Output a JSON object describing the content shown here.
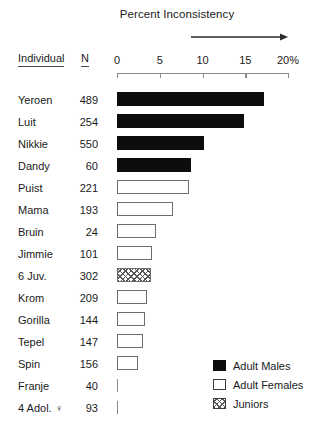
{
  "chart_data": {
    "type": "bar",
    "orientation": "horizontal",
    "title": "Percent Inconsistency",
    "xlabel": "",
    "ylabel": "Individual",
    "xlim": [
      0,
      20
    ],
    "grid": false,
    "axis": {
      "ticks": [
        0,
        5,
        10,
        15,
        20
      ],
      "tick_labels": [
        "0",
        "5",
        "10",
        "15",
        "20%"
      ]
    },
    "annotations": [
      {
        "name": "direction-arrow",
        "text": "",
        "description": "rightward arrow above axis spanning ~9% to ~20%"
      }
    ],
    "columns": [
      "Individual",
      "N"
    ],
    "categories": [
      "Yeroen",
      "Luit",
      "Nikkie",
      "Dandy",
      "Puist",
      "Mama",
      "Bruin",
      "Jimmie",
      "6 Juv.",
      "Krom",
      "Gorilla",
      "Tepel",
      "Spin",
      "Franje",
      "4 Adol. ♀"
    ],
    "n_values": [
      489,
      254,
      550,
      60,
      221,
      193,
      24,
      101,
      302,
      209,
      144,
      147,
      156,
      40,
      93
    ],
    "values": [
      17.2,
      14.8,
      10.2,
      8.7,
      8.4,
      6.5,
      4.6,
      4.1,
      4.0,
      3.5,
      3.3,
      3.0,
      2.4,
      0,
      0
    ],
    "groups": [
      "Adult Males",
      "Adult Males",
      "Adult Males",
      "Adult Males",
      "Adult Females",
      "Adult Females",
      "Adult Females",
      "Adult Females",
      "Juniors",
      "Adult Females",
      "Adult Females",
      "Adult Females",
      "Adult Females",
      "Adult Females",
      "Adult Females"
    ],
    "legend": {
      "position": "bottom-right",
      "entries": [
        {
          "label": "Adult Males",
          "style": "male"
        },
        {
          "label": "Adult Females",
          "style": "female"
        },
        {
          "label": "Juniors",
          "style": "junior"
        }
      ]
    },
    "colors": {
      "male": "#0d0d0d",
      "female": "#ffffff",
      "female_edge": "#6e6e6e",
      "junior_hatch": "#555555",
      "axis": "#8a8a8a",
      "text": "#1a1a1a"
    }
  }
}
